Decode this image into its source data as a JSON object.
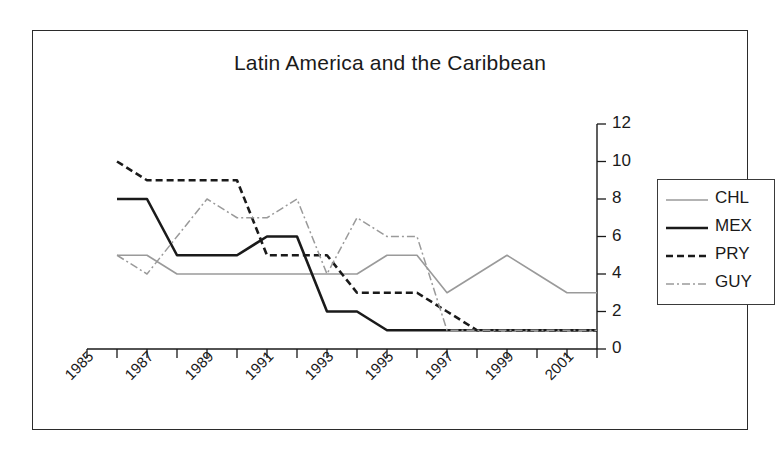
{
  "figure": {
    "title": "Latin America and the Caribbean",
    "background_color": "#ffffff",
    "frame_color": "#2b2b2b"
  },
  "axes": {
    "y_axis_position": "right",
    "y_ticks": [
      "0",
      "2",
      "4",
      "6",
      "8",
      "10",
      "12"
    ],
    "x_ticks_labeled": [
      "1985",
      "1987",
      "1989",
      "1991",
      "1993",
      "1995",
      "1997",
      "1999",
      "2001"
    ]
  },
  "legend": {
    "position": "right",
    "entries": [
      {
        "label": "CHL",
        "color": "#9a9a9a",
        "style": "solid-light"
      },
      {
        "label": "MEX",
        "color": "#1a1a1a",
        "style": "solid"
      },
      {
        "label": "PRY",
        "color": "#1a1a1a",
        "style": "dashed"
      },
      {
        "label": "GUY",
        "color": "#9a9a9a",
        "style": "dash-dot"
      }
    ]
  },
  "chart_data": {
    "type": "line",
    "title": "Latin America and the Caribbean",
    "xlabel": "",
    "ylabel": "",
    "xlim": [
      1985,
      2002
    ],
    "ylim": [
      0,
      12
    ],
    "y_ticks": [
      0,
      2,
      4,
      6,
      8,
      10,
      12
    ],
    "x_ticks": [
      1985,
      1986,
      1987,
      1988,
      1989,
      1990,
      1991,
      1992,
      1993,
      1994,
      1995,
      1996,
      1997,
      1998,
      1999,
      2000,
      2001,
      2002
    ],
    "x_tick_labels_shown": [
      1985,
      1987,
      1989,
      1991,
      1993,
      1995,
      1997,
      1999,
      2001
    ],
    "grid": false,
    "legend_position": "right",
    "x": [
      1986,
      1987,
      1988,
      1989,
      1990,
      1991,
      1992,
      1993,
      1994,
      1995,
      1996,
      1997,
      1998,
      1999,
      2000,
      2001,
      2002
    ],
    "series": [
      {
        "name": "CHL",
        "color": "#9a9a9a",
        "style": "solid-light",
        "values": [
          5,
          5,
          4,
          4,
          4,
          4,
          4,
          4,
          4,
          5,
          5,
          3,
          4,
          5,
          4,
          3,
          3
        ]
      },
      {
        "name": "MEX",
        "color": "#1a1a1a",
        "style": "solid",
        "values": [
          8,
          8,
          5,
          5,
          5,
          6,
          6,
          2,
          2,
          1,
          1,
          1,
          1,
          1,
          1,
          1,
          1
        ]
      },
      {
        "name": "PRY",
        "color": "#1a1a1a",
        "style": "dashed",
        "values": [
          10,
          9,
          9,
          9,
          9,
          5,
          5,
          5,
          3,
          3,
          3,
          2,
          1,
          1,
          1,
          1,
          1
        ]
      },
      {
        "name": "GUY",
        "color": "#9a9a9a",
        "style": "dash-dot",
        "values": [
          5,
          4,
          6,
          8,
          7,
          7,
          8,
          4,
          7,
          6,
          6,
          1,
          1,
          1,
          1,
          1,
          1
        ]
      }
    ]
  }
}
